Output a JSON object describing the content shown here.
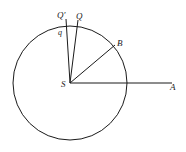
{
  "diagram": {
    "type": "geometry-circle-radii",
    "colors": {
      "stroke": "#1a1a1a",
      "background": "#ffffff"
    },
    "circle": {
      "center_label": "S",
      "cx": 70,
      "cy": 83,
      "r": 57
    },
    "segments": [
      {
        "id": "SA",
        "from": "S",
        "to": "A",
        "x2": 172,
        "y2": 83
      },
      {
        "id": "SB",
        "from": "S",
        "to": "B",
        "x2": 115,
        "y2": 45
      },
      {
        "id": "SQ",
        "from": "S",
        "to": "Q",
        "x2": 78,
        "y2": 20
      },
      {
        "id": "SQprime",
        "from": "S",
        "to": "Q'",
        "x2": 66,
        "y2": 19
      }
    ],
    "labels": {
      "S": "S",
      "A": "A",
      "B": "B",
      "Q": "Q",
      "Q_prime": "Q′",
      "q": "q"
    }
  }
}
